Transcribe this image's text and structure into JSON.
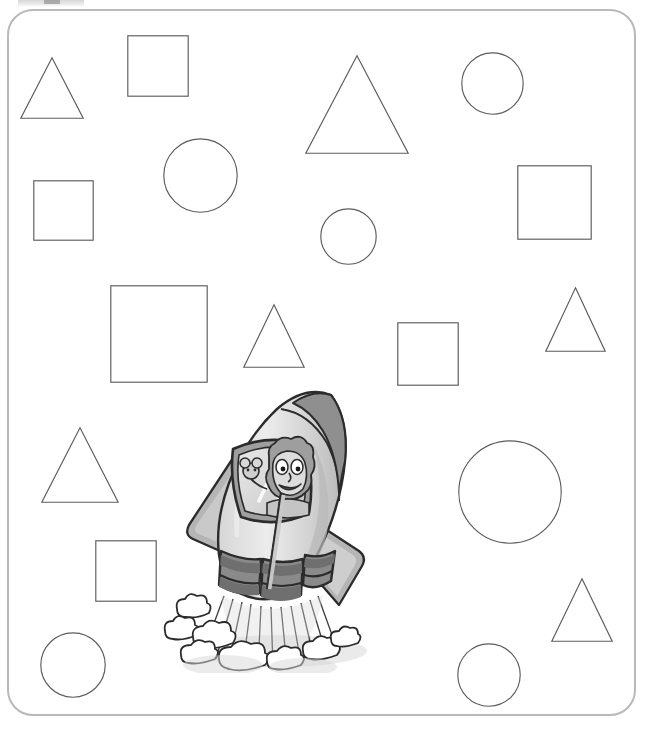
{
  "page": {
    "width": 652,
    "height": 730,
    "background_color": "#ffffff",
    "frame": {
      "name": "worksheet-border",
      "stroke_color": "#b9b9b9",
      "corner_radius": 26
    }
  },
  "artifact": {
    "name": "scan-artifact",
    "visible": true,
    "color": "#9a9a9a"
  },
  "shapes": {
    "stroke_color": "#5c5c5c",
    "fill": "none",
    "counts": {
      "triangles": 7,
      "squares": 7,
      "circles": 7,
      "total": 21
    },
    "items": [
      {
        "id": "triangle-1",
        "kind": "triangle",
        "label": "Triangle",
        "x": 20,
        "y": 57,
        "width": 64,
        "height": 62,
        "size": "small"
      },
      {
        "id": "square-1",
        "kind": "square",
        "label": "Square",
        "x": 127,
        "y": 35,
        "width": 62,
        "height": 62,
        "size": "small"
      },
      {
        "id": "triangle-2",
        "kind": "triangle",
        "label": "Triangle",
        "x": 305,
        "y": 55,
        "width": 104,
        "height": 99,
        "size": "large"
      },
      {
        "id": "circle-1",
        "kind": "circle",
        "label": "Circle",
        "x": 461,
        "y": 52,
        "width": 63,
        "height": 63,
        "size": "small"
      },
      {
        "id": "circle-2",
        "kind": "circle",
        "label": "Circle",
        "x": 163,
        "y": 138,
        "width": 75,
        "height": 75,
        "size": "medium"
      },
      {
        "id": "square-2",
        "kind": "square",
        "label": "Square",
        "x": 33,
        "y": 180,
        "width": 61,
        "height": 61,
        "size": "small"
      },
      {
        "id": "square-3",
        "kind": "square",
        "label": "Square",
        "x": 517,
        "y": 165,
        "width": 75,
        "height": 75,
        "size": "medium"
      },
      {
        "id": "circle-3",
        "kind": "circle",
        "label": "Circle",
        "x": 320,
        "y": 208,
        "width": 57,
        "height": 57,
        "size": "small"
      },
      {
        "id": "square-4",
        "kind": "square",
        "label": "Square",
        "x": 110,
        "y": 285,
        "width": 98,
        "height": 98,
        "size": "large"
      },
      {
        "id": "triangle-3",
        "kind": "triangle",
        "label": "Triangle",
        "x": 243,
        "y": 304,
        "width": 62,
        "height": 64,
        "size": "small"
      },
      {
        "id": "square-5",
        "kind": "square",
        "label": "Square",
        "x": 397,
        "y": 322,
        "width": 62,
        "height": 64,
        "size": "small"
      },
      {
        "id": "triangle-4",
        "kind": "triangle",
        "label": "Triangle",
        "x": 545,
        "y": 287,
        "width": 61,
        "height": 65,
        "size": "small"
      },
      {
        "id": "triangle-5",
        "kind": "triangle",
        "label": "Triangle",
        "x": 41,
        "y": 427,
        "width": 78,
        "height": 76,
        "size": "medium"
      },
      {
        "id": "circle-4",
        "kind": "circle",
        "label": "Circle",
        "x": 458,
        "y": 440,
        "width": 104,
        "height": 104,
        "size": "large"
      },
      {
        "id": "square-6",
        "kind": "square",
        "label": "Square",
        "x": 95,
        "y": 540,
        "width": 62,
        "height": 62,
        "size": "small"
      },
      {
        "id": "triangle-6",
        "kind": "triangle",
        "label": "Triangle",
        "x": 551,
        "y": 578,
        "width": 62,
        "height": 64,
        "size": "small"
      },
      {
        "id": "circle-5",
        "kind": "circle",
        "label": "Circle",
        "x": 40,
        "y": 632,
        "width": 66,
        "height": 66,
        "size": "medium"
      },
      {
        "id": "circle-6",
        "kind": "circle",
        "label": "Circle",
        "x": 457,
        "y": 643,
        "width": 64,
        "height": 64,
        "size": "medium"
      }
    ]
  },
  "rocket": {
    "name": "cartoon-rocket",
    "alt": "Cartoon rocket ship blasting off with a smiling astronaut and a small creature visible through the window, with exhaust flames and smoke clouds below",
    "colors": {
      "body_light": "#e2e2e2",
      "body_mid": "#c9c9c9",
      "body_shadow": "#b0b0b0",
      "nose_tip": "#8f8f8f",
      "fin": "#b5b5b5",
      "fin_shadow": "#9d9d9d",
      "engine_dark": "#8a8a8a",
      "engine_band": "#6f6f6f",
      "window_glass": "#dcdcdc",
      "outline": "#2b2b2b",
      "smoke": "#ffffff",
      "smoke_outline": "#3a3a3a",
      "shadow_gray": "#cdcdcd"
    },
    "parts": [
      {
        "id": "nose-cone",
        "label": "Nose cone"
      },
      {
        "id": "body",
        "label": "Rocket body"
      },
      {
        "id": "window",
        "label": "Cockpit window"
      },
      {
        "id": "astronaut",
        "label": "Astronaut character"
      },
      {
        "id": "creature",
        "label": "Small creature"
      },
      {
        "id": "fin-left",
        "label": "Left fin"
      },
      {
        "id": "fin-right",
        "label": "Right fin"
      },
      {
        "id": "engine",
        "label": "Engine nozzles"
      },
      {
        "id": "flame",
        "label": "Exhaust flame streaks"
      },
      {
        "id": "smoke",
        "label": "Smoke clouds"
      }
    ]
  }
}
